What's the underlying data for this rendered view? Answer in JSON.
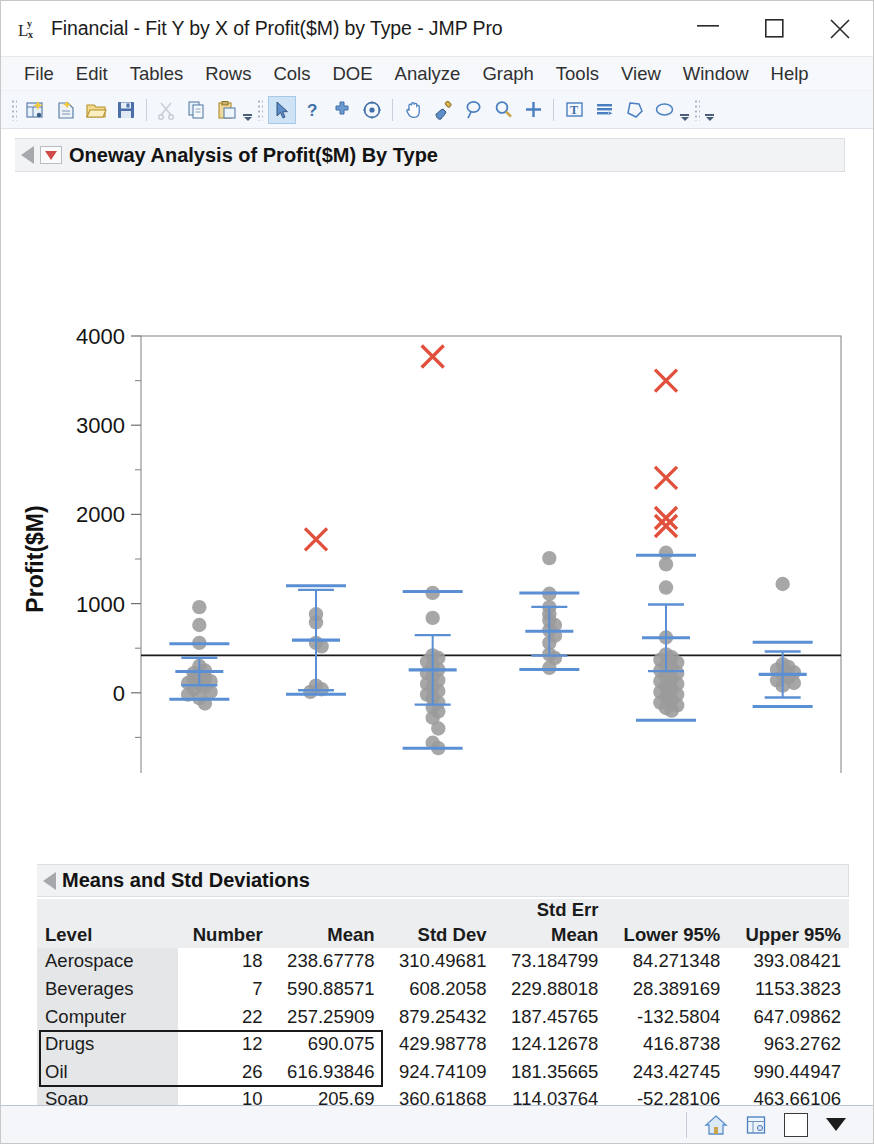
{
  "window": {
    "icon": "fit-y-by-x-icon",
    "title": "Financial - Fit Y by X of Profit($M) by Type - JMP Pro",
    "minimize_label": "–",
    "maximize_label": "□",
    "close_label": "✕"
  },
  "menubar": {
    "items": [
      {
        "label": "File"
      },
      {
        "label": "Edit"
      },
      {
        "label": "Tables"
      },
      {
        "label": "Rows"
      },
      {
        "label": "Cols"
      },
      {
        "label": "DOE"
      },
      {
        "label": "Analyze"
      },
      {
        "label": "Graph"
      },
      {
        "label": "Tools"
      },
      {
        "label": "View"
      },
      {
        "label": "Window"
      },
      {
        "label": "Help"
      }
    ]
  },
  "toolbar": {
    "groups": [
      {
        "buttons": [
          {
            "icon": "new-data-table-icon"
          },
          {
            "icon": "new-script-icon"
          },
          {
            "icon": "open-folder-icon"
          },
          {
            "icon": "save-icon"
          }
        ]
      },
      {
        "buttons": [
          {
            "icon": "cut-scissors-icon"
          },
          {
            "icon": "copy-icon"
          },
          {
            "icon": "paste-icon"
          }
        ]
      },
      {
        "buttons": [
          {
            "icon": "arrow-select-icon",
            "selected": true
          },
          {
            "icon": "question-help-icon"
          },
          {
            "icon": "crosshair-icon"
          },
          {
            "icon": "scroll-target-icon"
          }
        ]
      },
      {
        "buttons": [
          {
            "icon": "hand-grabber-icon"
          },
          {
            "icon": "paint-brush-icon"
          },
          {
            "icon": "lasso-icon"
          },
          {
            "icon": "magnifier-icon"
          },
          {
            "icon": "plus-crosshair-icon"
          }
        ]
      },
      {
        "buttons": [
          {
            "icon": "text-annotate-icon"
          },
          {
            "icon": "simple-shape-icon"
          },
          {
            "icon": "polygon-icon"
          },
          {
            "icon": "ellipse-icon"
          }
        ]
      }
    ]
  },
  "report": {
    "oneway": {
      "hotspot_icon": "red-triangle-hotspot-icon",
      "disclosure_icon": "disclosure-triangle-icon",
      "title": "Oneway Analysis of Profit($M) By Type"
    },
    "means_std": {
      "hotspot_icon": "disclosure-triangle-icon",
      "title": "Means and Std Deviations",
      "columns": [
        "Level",
        "Number",
        "Mean",
        "Std Dev",
        "Std Err Mean",
        "Lower 95%",
        "Upper 95%"
      ],
      "column_header_lines": {
        "std_err_mean_top": "Std Err",
        "std_err_mean_bottom": "Mean"
      },
      "rows": [
        {
          "level": "Aerospace",
          "number": "18",
          "mean": "238.67778",
          "std_dev": "310.49681",
          "std_err_mean": "73.184799",
          "lower95": "84.271348",
          "upper95": "393.08421",
          "selected": false
        },
        {
          "level": "Beverages",
          "number": "7",
          "mean": "590.88571",
          "std_dev": "608.2058",
          "std_err_mean": "229.88018",
          "lower95": "28.389169",
          "upper95": "1153.3823",
          "selected": false
        },
        {
          "level": "Computer",
          "number": "22",
          "mean": "257.25909",
          "std_dev": "879.25432",
          "std_err_mean": "187.45765",
          "lower95": "-132.5804",
          "upper95": "647.09862",
          "selected": false
        },
        {
          "level": "Drugs",
          "number": "12",
          "mean": "690.075",
          "std_dev": "429.98778",
          "std_err_mean": "124.12678",
          "lower95": "416.8738",
          "upper95": "963.2762",
          "selected": true
        },
        {
          "level": "Oil",
          "number": "26",
          "mean": "616.93846",
          "std_dev": "924.74109",
          "std_err_mean": "181.35665",
          "lower95": "243.42745",
          "upper95": "990.44947",
          "selected": true
        },
        {
          "level": "Soap",
          "number": "10",
          "mean": "205.69",
          "std_dev": "360.61868",
          "std_err_mean": "114.03764",
          "lower95": "-52.28106",
          "upper95": "463.66106",
          "selected": false
        }
      ],
      "footer": {
        "label": "Missing Rows",
        "value": "2"
      }
    }
  },
  "statusbar": {
    "buttons": [
      {
        "icon": "home-icon"
      },
      {
        "icon": "data-table-icon"
      },
      {
        "icon": "white-square-icon"
      },
      {
        "icon": "black-down-triangle-icon"
      }
    ]
  },
  "colors": {
    "point_gray": "#9b9b9b",
    "outlier_red": "#e1503c",
    "mean_line_blue": "#5b8fd4",
    "grand_mean_black": "#1a1a1a",
    "frame_gray": "#8b8b8b",
    "accent_blue": "#4a7fc1"
  },
  "chart_data": {
    "type": "scatter",
    "title": "Oneway Analysis of Profit($M) By Type",
    "xlabel": "Type",
    "ylabel": "Profit($M)",
    "categories": [
      "Aerospace",
      "Beverages",
      "Computer",
      "Drugs",
      "Oil",
      "Soap"
    ],
    "ylim": [
      -1000,
      4000
    ],
    "yticks": [
      -1000,
      0,
      1000,
      2000,
      3000,
      4000
    ],
    "ytick_labels": [
      "-1000",
      "0",
      "1000",
      "2000",
      "3000",
      "4000"
    ],
    "minor_ticks": [
      -500,
      500,
      1500,
      2500,
      3500
    ],
    "grid": false,
    "legend": null,
    "grand_mean": 420,
    "groups": [
      {
        "name": "Aerospace",
        "n": 18,
        "mean": 238.68,
        "mean_line": 238.68,
        "ci_lower": 84.27,
        "ci_upper": 393.08,
        "sd_lower": -71.82,
        "sd_upper": 549.17,
        "values": [
          960,
          760,
          560,
          300,
          250,
          220,
          190,
          170,
          150,
          130,
          110,
          90,
          70,
          40,
          10,
          -20,
          -60,
          -120
        ],
        "outliers": []
      },
      {
        "name": "Beverages",
        "n": 7,
        "mean": 590.89,
        "mean_line": 590.89,
        "ci_lower": 28.39,
        "ci_upper": 1153.38,
        "sd_lower": -17.32,
        "sd_upper": 1199.09,
        "values": [
          880,
          790,
          560,
          520,
          80,
          40,
          10
        ],
        "outliers": [
          1720
        ]
      },
      {
        "name": "Computer",
        "n": 22,
        "mean": 257.26,
        "mean_line": 257.26,
        "ci_lower": -132.58,
        "ci_upper": 647.1,
        "sd_lower": -622.0,
        "sd_upper": 1136.51,
        "values": [
          1120,
          840,
          420,
          390,
          350,
          300,
          260,
          220,
          180,
          140,
          100,
          60,
          20,
          -20,
          -60,
          -110,
          -160,
          -210,
          -280,
          -400,
          -560,
          -620
        ],
        "outliers": [
          3770
        ]
      },
      {
        "name": "Drugs",
        "n": 12,
        "mean": 690.08,
        "mean_line": 690.08,
        "ci_lower": 416.87,
        "ci_upper": 963.28,
        "sd_lower": 260.09,
        "sd_upper": 1120.06,
        "values": [
          1510,
          1110,
          960,
          880,
          810,
          760,
          700,
          640,
          560,
          430,
          390,
          280
        ],
        "outliers": []
      },
      {
        "name": "Oil",
        "n": 26,
        "mean": 616.94,
        "mean_line": 616.94,
        "ci_lower": 243.43,
        "ci_upper": 990.45,
        "sd_lower": -307.8,
        "sd_upper": 1541.68,
        "values": [
          1570,
          1440,
          1180,
          620,
          430,
          400,
          370,
          340,
          310,
          280,
          250,
          220,
          190,
          160,
          130,
          100,
          70,
          40,
          10,
          -20,
          -50,
          -80,
          -110,
          -140,
          -170,
          -200
        ],
        "outliers": [
          3500,
          2410,
          1960,
          1870
        ]
      },
      {
        "name": "Soap",
        "n": 10,
        "mean": 205.69,
        "mean_line": 205.69,
        "ci_lower": -52.28,
        "ci_upper": 463.66,
        "sd_lower": -154.93,
        "sd_upper": 566.31,
        "values": [
          1220,
          320,
          290,
          260,
          230,
          200,
          170,
          140,
          110,
          80
        ],
        "outliers": []
      }
    ]
  }
}
